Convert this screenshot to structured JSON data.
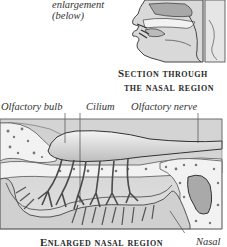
{
  "top_callout": {
    "line1": "enlargement",
    "line2": "(below)"
  },
  "section_caption": {
    "line1": "Section through",
    "line2": "the nasal region"
  },
  "labels": {
    "olfactory_bulb": "Olfactory bulb",
    "cilium": "Cilium",
    "olfactory_nerve": "Olfactory nerve"
  },
  "bottom_caption": {
    "title": "Enlarged nasal region",
    "side_label": "Nasal"
  },
  "colors": {
    "background": "#ffffff",
    "ink": "#333333",
    "tissue_mid": "#bdbdbd",
    "tissue_light": "#e2e2e2",
    "bone": "#f1f1f1"
  }
}
